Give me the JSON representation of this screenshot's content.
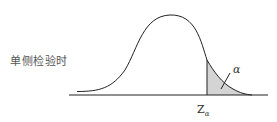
{
  "diagram": {
    "title": "单侧检验时",
    "critical_value_label": "Z",
    "critical_value_subscript": "α",
    "tail_area_label": "α",
    "colors": {
      "curve": "#222222",
      "shaded_region": "#d4d4d4",
      "baseline": "#222222",
      "text": "#444444"
    }
  }
}
